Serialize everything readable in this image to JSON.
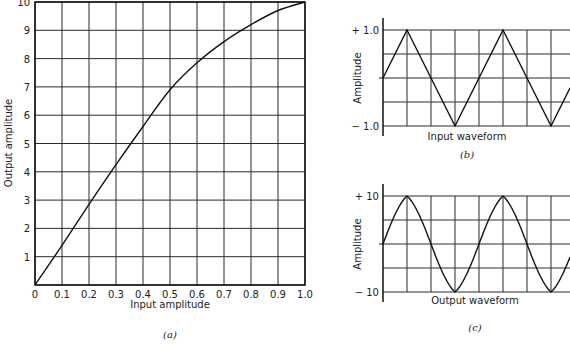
{
  "chart_data": [
    {
      "id": "a",
      "type": "line",
      "title": "",
      "caption": "(a)",
      "xlabel": "Input amplitude",
      "ylabel": "Output amplitude",
      "xlim": [
        0,
        1.0
      ],
      "ylim": [
        0,
        10
      ],
      "grid": true,
      "xticks": [
        "0",
        "0.1",
        "0.2",
        "0.3",
        "0.4",
        "0.5",
        "0.6",
        "0.7",
        "0.8",
        "0.9",
        "1.0"
      ],
      "yticks": [
        "0",
        "1",
        "2",
        "3",
        "4",
        "5",
        "6",
        "7",
        "8",
        "9",
        "10"
      ],
      "x": [
        0,
        0.1,
        0.2,
        0.3,
        0.4,
        0.5,
        0.6,
        0.7,
        0.8,
        0.9,
        1.0
      ],
      "y": [
        0,
        1.4,
        2.85,
        4.25,
        5.6,
        6.9,
        7.85,
        8.6,
        9.2,
        9.7,
        10.0
      ]
    },
    {
      "id": "b",
      "type": "line",
      "caption": "(b)",
      "xlabel": "Input waveform",
      "ylabel": "Amplitude",
      "ylim": [
        -1.0,
        1.0
      ],
      "yticks": [
        "+ 1.0",
        "− 1.0"
      ],
      "grid": true,
      "waveform": "triangle",
      "peak": 1.0,
      "cycles_visible": 2
    },
    {
      "id": "c",
      "type": "line",
      "caption": "(c)",
      "xlabel": "Output waveform",
      "ylabel": "Amplitude",
      "ylim": [
        -10,
        10
      ],
      "yticks": [
        "+ 10",
        "− 10"
      ],
      "grid": true,
      "waveform": "compressed-triangle (rounded peaks)",
      "peak": 10,
      "cycles_visible": 2
    }
  ],
  "labels": {
    "a_x": "Input amplitude",
    "a_y": "Output amplitude",
    "a_cap": "(a)",
    "b_x": "Input waveform",
    "b_y": "Amplitude",
    "b_top": "+ 1.0",
    "b_bot": "− 1.0",
    "b_cap": "(b)",
    "c_x": "Output waveform",
    "c_y": "Amplitude",
    "c_top": "+ 10",
    "c_bot": "− 10",
    "c_cap": "(c)"
  }
}
